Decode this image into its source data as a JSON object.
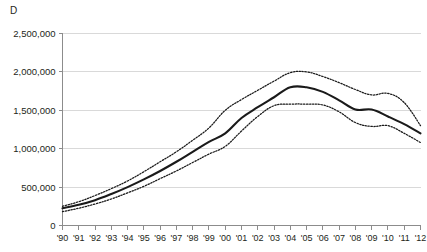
{
  "panel": {
    "label": "D"
  },
  "chart_data": {
    "type": "line",
    "title": "D",
    "xlabel": "",
    "ylabel": "",
    "grid": true,
    "legend": false,
    "ylim": [
      0,
      2500000
    ],
    "ytick_values": [
      0,
      500000,
      1000000,
      1500000,
      2000000,
      2500000
    ],
    "ytick_labels": [
      "0",
      "500,000",
      "1,000,000",
      "1,500,000",
      "2,000,000",
      "2,500,000"
    ],
    "categories": [
      "'90",
      "'91",
      "'92",
      "'93",
      "'94",
      "'95",
      "'96",
      "'97",
      "'98",
      "'99",
      "'00",
      "'01",
      "'02",
      "'03",
      "'04",
      "'05",
      "'06",
      "'07",
      "'08",
      "'09",
      "'10",
      "'11",
      "'12"
    ],
    "x": [
      1990,
      1991,
      1992,
      1993,
      1994,
      1995,
      1996,
      1997,
      1998,
      1999,
      2000,
      2001,
      2002,
      2003,
      2004,
      2005,
      2006,
      2007,
      2008,
      2009,
      2010,
      2011,
      2012
    ],
    "series": [
      {
        "name": "upper-bound",
        "style": "dotted",
        "color": "#1a1a1a",
        "values": [
          250000,
          310000,
          390000,
          480000,
          580000,
          700000,
          830000,
          960000,
          1110000,
          1270000,
          1500000,
          1640000,
          1760000,
          1880000,
          1990000,
          2000000,
          1940000,
          1860000,
          1770000,
          1700000,
          1720000,
          1600000,
          1300000
        ]
      },
      {
        "name": "central-estimate",
        "style": "solid",
        "color": "#1a1a1a",
        "values": [
          225000,
          270000,
          330000,
          410000,
          500000,
          600000,
          710000,
          830000,
          960000,
          1090000,
          1200000,
          1400000,
          1540000,
          1670000,
          1800000,
          1800000,
          1740000,
          1630000,
          1510000,
          1510000,
          1420000,
          1320000,
          1200000
        ]
      },
      {
        "name": "lower-bound",
        "style": "dotted",
        "color": "#1a1a1a",
        "values": [
          180000,
          225000,
          280000,
          345000,
          425000,
          510000,
          610000,
          710000,
          820000,
          930000,
          1030000,
          1230000,
          1420000,
          1560000,
          1580000,
          1580000,
          1570000,
          1480000,
          1340000,
          1290000,
          1300000,
          1200000,
          1080000
        ]
      }
    ],
    "colors": {
      "line": "#1a1a1a",
      "grid": "#d9d9d9",
      "axis": "#8c8c8c",
      "text": "#231f20",
      "background": "#ffffff"
    }
  }
}
